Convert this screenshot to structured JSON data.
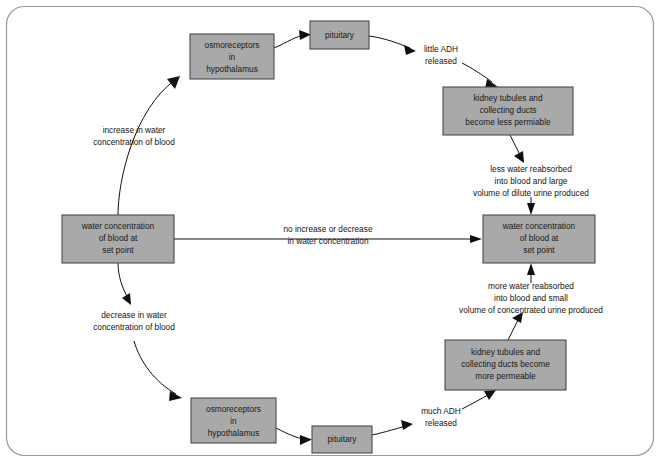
{
  "diagram": {
    "colors": {
      "box_fill": "#a9a9a9",
      "box_border": "#4a4a4a",
      "frame_border": "#9a9a9a",
      "background": "#ffffff",
      "text": "#141414",
      "connector": "#101010"
    },
    "frame": {
      "x": 6,
      "y": 6,
      "width": 648,
      "height": 450,
      "radius": 18
    },
    "nodes": [
      {
        "id": "osmoreceptors-top",
        "lines": [
          "osmoreceptors",
          "in",
          "hypothalamus"
        ],
        "x": 190,
        "y": 34,
        "width": 84,
        "height": 45
      },
      {
        "id": "pituitary-top",
        "lines": [
          "pituitary"
        ],
        "x": 310,
        "y": 21,
        "width": 59,
        "height": 28
      },
      {
        "id": "kidney-less-permeable",
        "lines": [
          "kidney tubules and",
          "collecting ducts",
          "become less permiable"
        ],
        "x": 443,
        "y": 87,
        "width": 130,
        "height": 48
      },
      {
        "id": "water-setpoint-left",
        "lines": [
          "water concentration",
          "of blood at",
          "set point"
        ],
        "x": 62,
        "y": 215,
        "width": 112,
        "height": 48
      },
      {
        "id": "water-setpoint-right",
        "lines": [
          "water concentration",
          "of blood at",
          "set point"
        ],
        "x": 483,
        "y": 215,
        "width": 112,
        "height": 48
      },
      {
        "id": "kidney-more-permeable",
        "lines": [
          "kidney tubules and",
          "collecting ducts become",
          "more permeable"
        ],
        "x": 445,
        "y": 340,
        "width": 121,
        "height": 50
      },
      {
        "id": "osmoreceptors-bottom",
        "lines": [
          "osmoreceptors",
          "in",
          "hypothalamus"
        ],
        "x": 191,
        "y": 398,
        "width": 85,
        "height": 45
      },
      {
        "id": "pituitary-bottom",
        "lines": [
          "pituitary"
        ],
        "x": 312,
        "y": 426,
        "width": 60,
        "height": 27
      }
    ],
    "edge_labels": [
      {
        "id": "little-adh",
        "lines": [
          "little ADH",
          "released"
        ],
        "cx": 441,
        "cy": 56
      },
      {
        "id": "less-water-reabsorbed",
        "lines": [
          "less water reabsorbed",
          "into blood and large",
          "volume of dilute urine produced"
        ],
        "cx": 531,
        "cy": 182
      },
      {
        "id": "increase-in-water",
        "lines": [
          "increase in water",
          "concentration of blood"
        ],
        "cx": 134,
        "cy": 137
      },
      {
        "id": "no-increase-or-decrease",
        "lines": [
          "no increase or decrease",
          "in water concentration"
        ],
        "cx": 328,
        "cy": 236
      },
      {
        "id": "decrease-in-water",
        "lines": [
          "decrease in water",
          "concentration of blood"
        ],
        "cx": 134,
        "cy": 322
      },
      {
        "id": "more-water-reabsorbed",
        "lines": [
          "more water reabsorbed",
          "into blood and small",
          "volume of concentrated urine produced"
        ],
        "cx": 531,
        "cy": 299
      },
      {
        "id": "much-adh",
        "lines": [
          "much ADH",
          "released"
        ],
        "cx": 441,
        "cy": 418
      }
    ],
    "flow_sequence": [
      "water concentration of blood at set point",
      "increase in water concentration of blood",
      "osmoreceptors in hypothalamus",
      "pituitary",
      "little ADH released",
      "kidney tubules and collecting ducts become less permiable",
      "less water reabsorbed into blood and large volume of dilute urine produced",
      "water concentration of blood at set point"
    ],
    "flow_sequence_lower": [
      "water concentration of blood at set point",
      "decrease in water concentration of blood",
      "osmoreceptors in hypothalamus",
      "pituitary",
      "much ADH released",
      "kidney tubules and collecting ducts become more permeable",
      "more water reabsorbed into blood and small volume of concentrated urine produced",
      "water concentration of blood at set point"
    ]
  }
}
